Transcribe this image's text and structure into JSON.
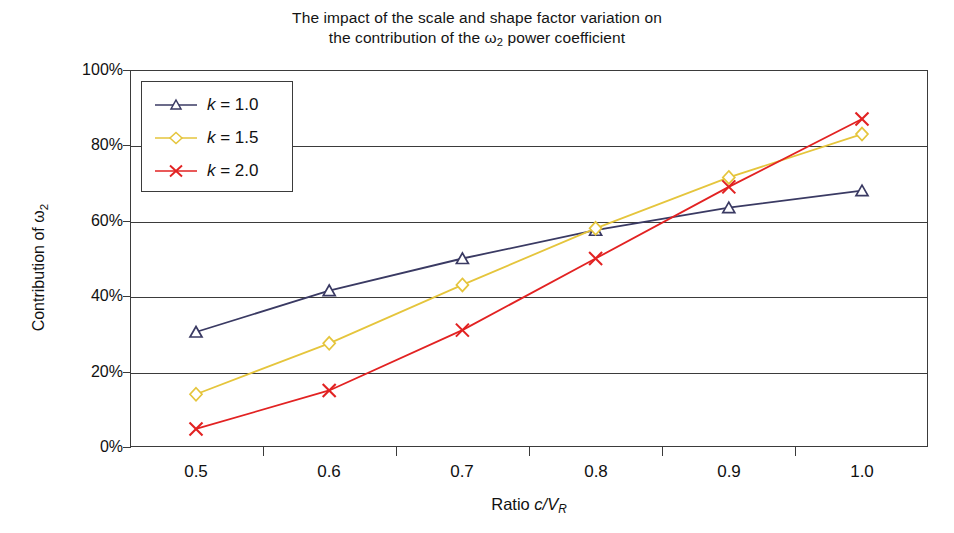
{
  "chart_data": {
    "type": "line",
    "title_line1": "The impact of the scale and shape factor variation on",
    "title_line2_pre": "the contribution of the ",
    "title_line2_omega": "ω",
    "title_line2_sub": "2",
    "title_line2_post": " power coefficient",
    "xlabel": "Ratio c/V_R",
    "xlabel_pre": "Ratio ",
    "xlabel_c": "c",
    "xlabel_slash": "/",
    "xlabel_V": "V",
    "xlabel_Vsub": "R",
    "ylabel": "Contribution of ω₂",
    "ylabel_pre": "Contribution of ",
    "ylabel_omega": "ω",
    "ylabel_sub": "2",
    "x": [
      0.5,
      0.6,
      0.7,
      0.8,
      0.9,
      1.0
    ],
    "xtick_labels": [
      "0.5",
      "0.6",
      "0.7",
      "0.8",
      "0.9",
      "1.0"
    ],
    "ytick_labels": [
      "0%",
      "20%",
      "40%",
      "60%",
      "80%",
      "100%"
    ],
    "ytick_values": [
      0,
      20,
      40,
      60,
      80,
      100
    ],
    "ylim": [
      0,
      100
    ],
    "xlim": [
      0.45,
      1.05
    ],
    "grid": true,
    "legend_position": "top-left",
    "series": [
      {
        "name": "k = 1.0",
        "legend_pre": "k",
        "legend_post": " = 1.0",
        "color": "#3a3a63",
        "marker": "triangle",
        "values": [
          30.5,
          41.5,
          50.0,
          57.5,
          63.5,
          68.0
        ]
      },
      {
        "name": "k = 1.5",
        "legend_pre": "k",
        "legend_post": " = 1.5",
        "color": "#e5c53c",
        "marker": "diamond",
        "values": [
          14.0,
          27.5,
          43.0,
          58.0,
          71.5,
          83.0
        ]
      },
      {
        "name": "k = 2.0",
        "legend_pre": "k",
        "legend_post": " = 2.0",
        "color": "#e22222",
        "marker": "x",
        "values": [
          4.8,
          15.0,
          31.0,
          50.0,
          69.0,
          87.0
        ]
      }
    ],
    "axis_color": "#3b3b3b",
    "background": "#ffffff"
  }
}
